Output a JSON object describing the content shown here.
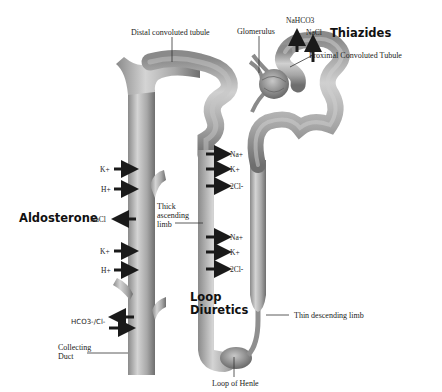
{
  "diagram": {
    "structures": {
      "distal_convoluted_tubule": "Distal convoluted tubule",
      "glomerulus": "Glomerulus",
      "proximal_convoluted_tubule": "Proximal Convoluted Tubule",
      "thick_ascending_limb": "Thick\nascending\nlimb",
      "thin_descending_limb": "Thin descending limb",
      "loop_of_henle": "Loop of Henle",
      "collecting_duct": "Collecting\nDuct"
    },
    "drugs": {
      "thiazides": "Thiazides",
      "aldosterone": "Aldosterone",
      "loop_diuretics": "Loop\nDiuretics"
    },
    "ions": {
      "pct_nahco3": "NaHCO3",
      "pct_nacl": "NaCl",
      "cd_k1": "K+",
      "cd_h1": "H+",
      "cd_nacl": "NaCl",
      "cd_k2": "K+",
      "cd_h2": "H+",
      "cd_hco3cl": "HCO3-/Cl-",
      "tal_na1": "Na+",
      "tal_k1": "K+",
      "tal_2cl1": "2Cl-",
      "tal_na2": "Na+",
      "tal_k2": "K+",
      "tal_2cl2": "2Cl-"
    },
    "colors": {
      "tubule_fill": "#b5b5b5",
      "tubule_shadow": "#7a7a7a",
      "arrow": "#1a1a1a",
      "text": "#222222",
      "background": "#ffffff"
    }
  }
}
